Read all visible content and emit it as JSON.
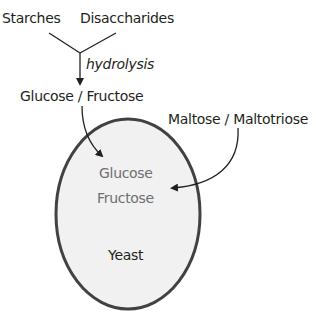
{
  "diagram": {
    "inputs": [
      "Starches",
      "Disaccharides"
    ],
    "process_label": "hydrolysis",
    "product": "Glucose / Fructose",
    "external_sugars": "Maltose / Maltotriose",
    "cell": {
      "contents": [
        "Glucose",
        "Fructose"
      ],
      "label": "Yeast",
      "fill": "#f1f1f2",
      "stroke": "#414042"
    }
  }
}
